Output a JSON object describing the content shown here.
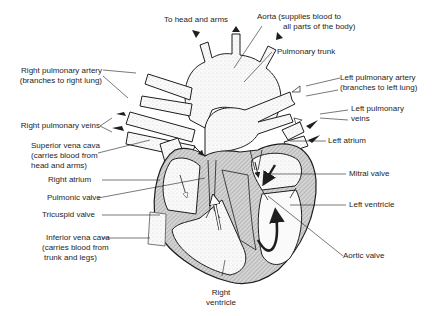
{
  "diagram": {
    "colors": {
      "ink": "#1e1e1e",
      "wall_fill": "#bdbdbd",
      "stipple": "#e6e6e6",
      "background": "#ffffff"
    },
    "labels": {
      "to_head_and_arms": "To head and arms",
      "aorta_line1": "Aorta (supplies blood to",
      "aorta_line2": "all parts of the body)",
      "pulmonary_trunk": "Pulmonary trunk",
      "right_pulmonary_artery_line1": "Right pulmonary artery",
      "right_pulmonary_artery_line2": "(branches to right lung)",
      "left_pulmonary_artery_line1": "Left pulmonary artery",
      "left_pulmonary_artery_line2": "(branches to left lung)",
      "left_pulmonary_veins_line1": "Left pulmonary",
      "left_pulmonary_veins_line2": "veins",
      "right_pulmonary_veins": "Right pulmonary veins",
      "superior_vena_cava_line1": "Superior vena cava",
      "superior_vena_cava_line2": "(carries blood from",
      "superior_vena_cava_line3": "head and arms)",
      "left_atrium": "Left atrium",
      "right_atrium": "Right atrium",
      "mitral_valve": "Mitral valve",
      "pulmonic_valve": "Pulmonic valve",
      "left_ventricle": "Left ventricle",
      "tricuspid_valve": "Tricuspid valve",
      "inferior_vena_cava_line1": "Inferior vena cava",
      "inferior_vena_cava_line2": "(carries blood from",
      "inferior_vena_cava_line3": "trunk and legs)",
      "aortic_valve": "Aortic valve",
      "right_ventricle_line1": "Right",
      "right_ventricle_line2": "ventricle"
    }
  }
}
